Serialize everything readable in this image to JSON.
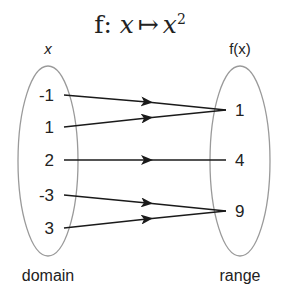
{
  "title": {
    "prefix": "f: ",
    "var": "x",
    "mapsto": "↦",
    "result_base": "x",
    "result_exp": "2"
  },
  "domain": {
    "header": "x",
    "caption": "domain",
    "values": [
      "-1",
      "1",
      "2",
      "-3",
      "3"
    ]
  },
  "range": {
    "header": "f(x)",
    "caption": "range",
    "values": [
      "1",
      "4",
      "9"
    ]
  },
  "mappings": [
    {
      "from": "-1",
      "to": "1"
    },
    {
      "from": "1",
      "to": "1"
    },
    {
      "from": "2",
      "to": "4"
    },
    {
      "from": "-3",
      "to": "9"
    },
    {
      "from": "3",
      "to": "9"
    }
  ],
  "colors": {
    "ellipse_stroke": "#9a9a9a",
    "arrow": "#1a1a1a",
    "text": "#222222"
  }
}
